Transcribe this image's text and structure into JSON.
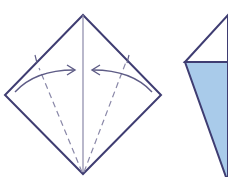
{
  "diagram": {
    "type": "origami-fold-instructions",
    "steps": [
      {
        "name": "kite-base-fold",
        "description": "Square diamond with center crease; fold left and right edges to center line along dashed lines",
        "shape": "diamond",
        "folds": [
          "left-edge-to-center",
          "right-edge-to-center"
        ]
      },
      {
        "name": "folded-result-partial",
        "description": "Partially visible result with blue colored flap",
        "shape": "kite-partial"
      }
    ]
  },
  "colors": {
    "outline": "#3f3d72",
    "crease": "#8a88a8",
    "arrow": "#5e5c86",
    "flap_fill": "#a9cbea",
    "background": "#ffffff"
  }
}
